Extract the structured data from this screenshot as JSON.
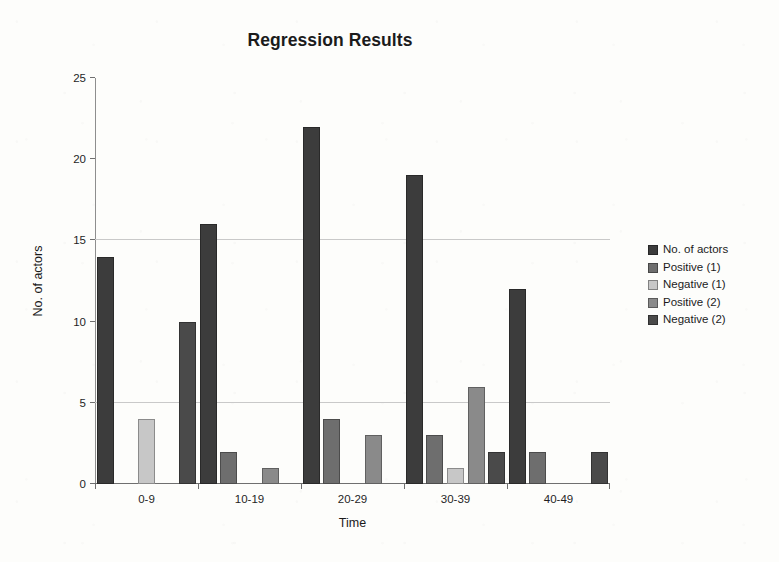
{
  "chart_data": {
    "type": "bar",
    "title": "Regression Results",
    "xlabel": "Time",
    "ylabel": "No. of actors",
    "ylim": [
      0,
      25
    ],
    "yticks": [
      0,
      5,
      10,
      15,
      20,
      25
    ],
    "gridlines": [
      5,
      15
    ],
    "grid": true,
    "legend_position": "right",
    "categories": [
      "0-9",
      "10-19",
      "20-29",
      "30-39",
      "40-49"
    ],
    "series": [
      {
        "name": "No. of actors",
        "color": "#3c3c3c",
        "values": [
          14,
          16,
          22,
          19,
          12
        ]
      },
      {
        "name": "Positive (1)",
        "color": "#6e6e6e",
        "values": [
          0,
          2,
          4,
          3,
          2
        ]
      },
      {
        "name": "Negative (1)",
        "color": "#c7c7c7",
        "values": [
          4,
          0,
          0,
          1,
          0
        ]
      },
      {
        "name": "Positive (2)",
        "color": "#8a8a8a",
        "values": [
          0,
          1,
          3,
          6,
          0
        ]
      },
      {
        "name": "Negative  (2)",
        "color": "#4a4a4a",
        "values": [
          10,
          0,
          0,
          2,
          2
        ]
      }
    ]
  },
  "colors": {
    "axis": "#6f6f6f",
    "grid": "#c9c9c9",
    "text": "#1a1a1a",
    "background": "#fdfdfb"
  }
}
